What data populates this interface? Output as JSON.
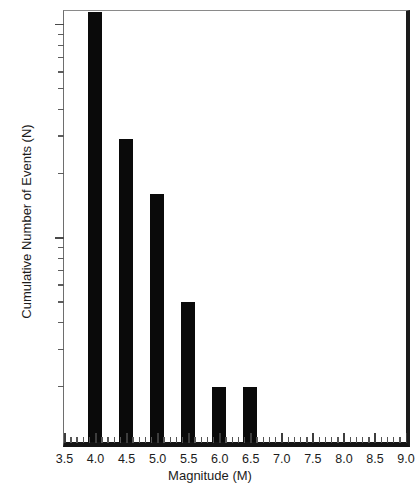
{
  "chart_data": {
    "type": "bar",
    "title": "",
    "xlabel": "Magnitude (M)",
    "ylabel": "Cumulative Number of Events (N)",
    "xlim": [
      3.5,
      9.0
    ],
    "ylim": [
      1.1,
      115
    ],
    "yscale": "log",
    "xscale": "linear",
    "grid": false,
    "legend": null,
    "x_major_step": 0.5,
    "x_minor_step": 0.1,
    "categories": [
      4.0,
      4.5,
      5.0,
      5.5,
      6.0,
      6.5
    ],
    "values": [
      115,
      29,
      16,
      5,
      2,
      2
    ],
    "value_notes": [
      "clipped at top of axis (>100)",
      "",
      "",
      "",
      "",
      ""
    ],
    "bar_width_magnitude": 0.22,
    "xticklabels": [
      "3.5",
      "4.0",
      "4.5",
      "5.0",
      "5.5",
      "6.0",
      "6.5",
      "7.0",
      "7.5",
      "8.0",
      "8.5",
      "9.0"
    ],
    "xtickvalues": [
      3.5,
      4.0,
      4.5,
      5.0,
      5.5,
      6.0,
      6.5,
      7.0,
      7.5,
      8.0,
      8.5,
      9.0
    ],
    "yticklabels": [
      "100",
      "10"
    ],
    "ytickvalues": [
      100,
      10
    ],
    "y_minor_ticks": [
      90,
      80,
      70,
      60,
      50,
      40,
      30,
      20,
      9,
      8,
      7,
      6,
      5,
      4,
      3,
      2
    ],
    "colors": {
      "bar": "#0a0a0a",
      "axis": "#1b1b1b",
      "background": "#ffffff"
    }
  }
}
